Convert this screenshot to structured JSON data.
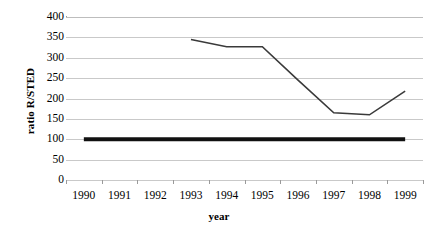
{
  "chart_data": {
    "type": "line",
    "title": "",
    "xlabel": "year",
    "ylabel": "ratio R/STED",
    "categories": [
      "1990",
      "1991",
      "1992",
      "1993",
      "1994",
      "1995",
      "1996",
      "1997",
      "1998",
      "1999"
    ],
    "x": [
      1990,
      1991,
      1992,
      1993,
      1994,
      1995,
      1996,
      1997,
      1998,
      1999
    ],
    "ylim": [
      0,
      400
    ],
    "ytick_labels": [
      "400",
      "350",
      "300",
      "250",
      "200",
      "150",
      "100",
      "50",
      "0"
    ],
    "yticks": [
      400,
      350,
      300,
      250,
      200,
      150,
      100,
      50,
      0
    ],
    "grid": "horizontal",
    "legend": "none",
    "series": [
      {
        "name": "ratio R/STED",
        "color": "#3a3a3a",
        "line_width": 1.6,
        "values": [
          null,
          null,
          null,
          345,
          327,
          327,
          245,
          165,
          160,
          218
        ]
      },
      {
        "name": "reference line",
        "color": "#111111",
        "line_width": 4,
        "values": [
          100,
          100,
          100,
          100,
          100,
          100,
          100,
          100,
          100,
          100
        ]
      }
    ]
  }
}
